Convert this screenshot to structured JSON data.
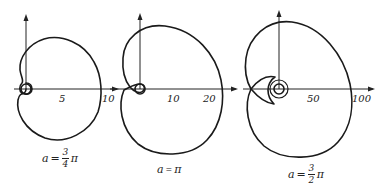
{
  "figures": [
    {
      "id": "fig1",
      "caption": {
        "variable": "a",
        "equals": "=",
        "numerator": "3",
        "denominator": "4",
        "pi": "π"
      },
      "ticks": [
        "5",
        "10"
      ]
    },
    {
      "id": "fig2",
      "caption": {
        "variable": "a",
        "equals": "=",
        "text": "π"
      },
      "ticks": [
        "10",
        "20"
      ]
    },
    {
      "id": "fig3",
      "caption": {
        "variable": "a",
        "equals": "=",
        "numerator": "3",
        "denominator": "2",
        "pi": "π"
      },
      "ticks": [
        "50",
        "100"
      ]
    }
  ],
  "colors": {
    "stroke": "#1a1a1a",
    "background": "#ffffff"
  }
}
